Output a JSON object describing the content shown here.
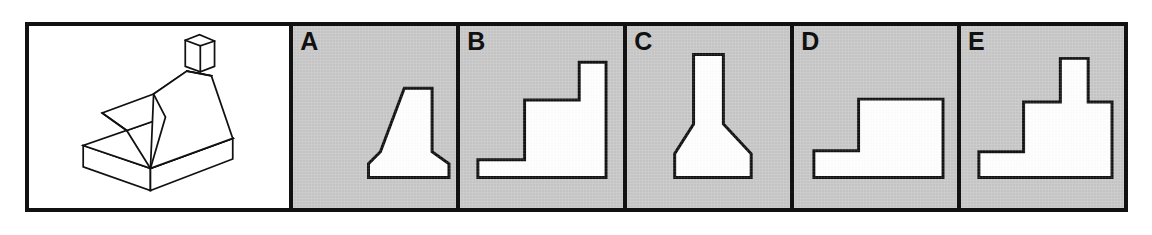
{
  "figure": {
    "kind": "orthographic-projection-multiple-choice",
    "colors": {
      "panel_background": "#c8c8c8",
      "pictorial_background": "#ffffff",
      "line": "#111111",
      "shape_fill": "#ffffff"
    },
    "border_width_px": 4
  },
  "pictorial": {
    "label": "",
    "description": "isometric pictorial of a part: rectangular base slab with a tapered wedge block and a small square boss on top",
    "stroke_width": 2.2,
    "paths": [
      "M 33 151 L 33 178 L 118 208 L 118 180 Z",
      "M 118 208 L 118 180 L 222 142 L 222 168 Z",
      "M 33 151 L 118 180 L 222 142 L 137 115 Z",
      "M 137 115 L 88 132 L 57 110 L 122 86 L 164 57 L 195 63 Z",
      "M 118 180 L 122 86 L 164 57 L 195 63 L 222 142 Z",
      "M 57 110 L 88 132 L 118 180",
      "M 122 86 L 137 115 L 118 180",
      "M 164 57 L 195 63",
      "M 162 18 L 180 11 L 199 19 L 199 51 L 181 58 L 162 51 Z",
      "M 162 18 L 181 25 L 199 19",
      "M 181 25 L 181 58"
    ]
  },
  "options": [
    {
      "id": "A",
      "label": "A",
      "shape_name": "funnel-profile",
      "description": "narrow rectangular neck at top flaring outward to a wide chamfered base",
      "points": "76,152 76,138 88,126 112,62 140,62 140,126 157,138 157,152 76,152",
      "stroke_width": 3
    },
    {
      "id": "B",
      "label": "B",
      "shape_name": "staircase-profile",
      "description": "two-step staircase rising left to right with tall riser at right",
      "points": "18,152 18,134 65,134 65,74 120,74 120,36 147,36 147,152 18,152",
      "stroke_width": 3
    },
    {
      "id": "C",
      "label": "C",
      "shape_name": "bottle-profile",
      "description": "tall straight neck widening into a tapered body with chamfered base corners",
      "points": "48,152 48,128 67,98 67,28 97,28 97,98 125,128 125,152 48,152",
      "stroke_width": 3
    },
    {
      "id": "D",
      "label": "D",
      "shape_name": "L-step-profile",
      "description": "L-shaped block: low ledge on the left and tall rectangular body on the right",
      "points": "20,152 20,125 65,125 65,73 150,73 150,152 20,152",
      "stroke_width": 3
    },
    {
      "id": "E",
      "label": "E",
      "shape_name": "L-step-with-boss-profile",
      "description": "L-shaped block with a narrow rectangular boss projecting from the top",
      "points": "18,152 18,126 63,126 63,76 100,76 100,32 128,32 128,76 152,76 152,152 18,152",
      "stroke_width": 3
    }
  ]
}
